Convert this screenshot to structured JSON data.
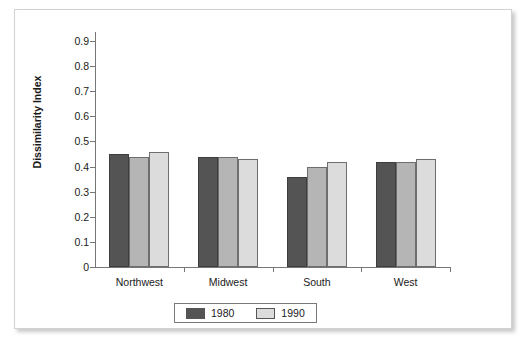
{
  "chart_data": {
    "type": "bar",
    "title": "",
    "xlabel": "",
    "ylabel": "Dissimilarity Index",
    "ylim": [
      0,
      0.9
    ],
    "grid": false,
    "legend_position": "bottom",
    "categories": [
      "Northwest",
      "Midwest",
      "South",
      "West"
    ],
    "y_ticks": [
      "0",
      "0.1",
      "0.2",
      "0.3",
      "0.4",
      "0.5",
      "0.6",
      "0.7",
      "0.8",
      "0.9"
    ],
    "y_tick_values": [
      0,
      0.1,
      0.2,
      0.3,
      0.4,
      0.5,
      0.6,
      0.7,
      0.8,
      0.9
    ],
    "series": [
      {
        "name": "1980",
        "color": "#545454",
        "values": [
          0.45,
          0.44,
          0.36,
          0.42
        ]
      },
      {
        "name": "1990",
        "color": "#b5b5b5",
        "values": [
          0.44,
          0.44,
          0.4,
          0.42
        ]
      },
      {
        "name": "",
        "color": "#dcdcdc",
        "values": [
          0.46,
          0.43,
          0.42,
          0.43
        ]
      }
    ],
    "legend": [
      {
        "label": "1980",
        "color": "#545454"
      },
      {
        "label": "1990",
        "color": "#dcdcdc"
      }
    ]
  },
  "colors": {
    "frame_border": "#d2d2d2",
    "axis": "#767676",
    "text": "#1a1a1a",
    "background": "#ffffff"
  }
}
